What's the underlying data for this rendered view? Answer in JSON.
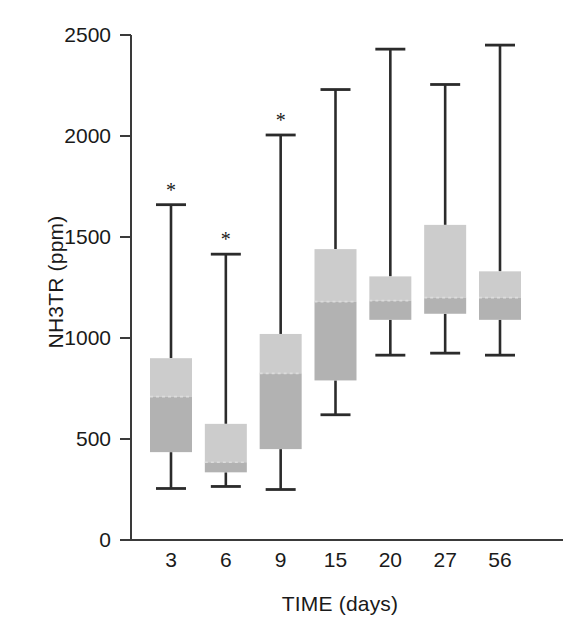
{
  "chart_data": {
    "type": "box",
    "title": "",
    "xlabel": "TIME (days)",
    "ylabel": "NH3TR (ppm)",
    "categories": [
      "3",
      "6",
      "9",
      "15",
      "20",
      "27",
      "56"
    ],
    "ylim": [
      0,
      2500
    ],
    "yticks": [
      0,
      500,
      1000,
      1500,
      2000,
      2500
    ],
    "ytick_labels": [
      "0",
      "500",
      "1000",
      "1500",
      "2000",
      "2500"
    ],
    "grid": false,
    "legend": "none",
    "annotation_symbol": "*",
    "annotation_note": "asterisk marks significant groups (days 3, 6 and 9)",
    "colors": {
      "box_upper": "#cccccc",
      "box_lower": "#b2b2b2",
      "median": "#dcdcdc",
      "whisker": "#2b2b2b",
      "axis": "#3a3a3a",
      "text": "#1a1a1a",
      "background": "#ffffff"
    },
    "boxes": [
      {
        "category": "3",
        "whisker_low": 255,
        "q1": 435,
        "median": 710,
        "q3": 900,
        "whisker_high": 1660,
        "significant": true
      },
      {
        "category": "6",
        "whisker_low": 265,
        "q1": 335,
        "median": 385,
        "q3": 575,
        "whisker_high": 1415,
        "significant": true
      },
      {
        "category": "9",
        "whisker_low": 250,
        "q1": 450,
        "median": 825,
        "q3": 1020,
        "whisker_high": 2005,
        "significant": true
      },
      {
        "category": "15",
        "whisker_low": 620,
        "q1": 790,
        "median": 1180,
        "q3": 1440,
        "whisker_high": 2230,
        "significant": false
      },
      {
        "category": "20",
        "whisker_low": 915,
        "q1": 1090,
        "median": 1185,
        "q3": 1305,
        "whisker_high": 2430,
        "significant": false
      },
      {
        "category": "27",
        "whisker_low": 925,
        "q1": 1120,
        "median": 1200,
        "q3": 1560,
        "whisker_high": 2255,
        "significant": false
      },
      {
        "category": "56",
        "whisker_low": 915,
        "q1": 1090,
        "median": 1200,
        "q3": 1330,
        "whisker_high": 2450,
        "significant": false
      }
    ]
  }
}
